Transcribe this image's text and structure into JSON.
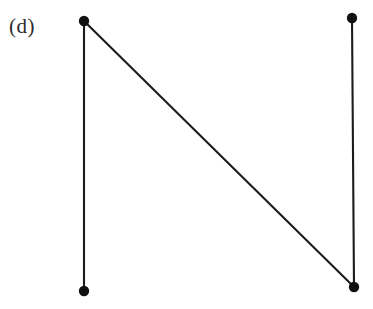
{
  "figure": {
    "panel_label": "(d)",
    "background_color": "#ffffff",
    "stroke_color": "#1c1c1c",
    "vertex_color": "#111111",
    "label_color": "#2b2b2b",
    "width": 373,
    "height": 309
  },
  "chart_data": {
    "type": "diagram",
    "title": "(d)",
    "subtitle": "",
    "xlabel": "",
    "ylabel": "",
    "graph_kind": "undirected-graph",
    "vertex_count": 4,
    "edge_count": 3,
    "vertex_radius": 5.2,
    "edge_width": 2.1,
    "grid": false,
    "legend": false,
    "axis_visible": false,
    "xlim": [
      0,
      373
    ],
    "ylim": [
      0,
      309
    ],
    "vertices": [
      {
        "id": "v1",
        "label": "",
        "x": 84,
        "y": 21
      },
      {
        "id": "v2",
        "label": "",
        "x": 352,
        "y": 18
      },
      {
        "id": "v3",
        "label": "",
        "x": 84,
        "y": 291
      },
      {
        "id": "v4",
        "label": "",
        "x": 354,
        "y": 287
      }
    ],
    "edges": [
      {
        "id": "e1",
        "from": "v1",
        "to": "v3",
        "kind": "vertical-left"
      },
      {
        "id": "e2",
        "from": "v2",
        "to": "v4",
        "kind": "vertical-right"
      },
      {
        "id": "e3",
        "from": "v1",
        "to": "v4",
        "kind": "diagonal"
      }
    ]
  }
}
